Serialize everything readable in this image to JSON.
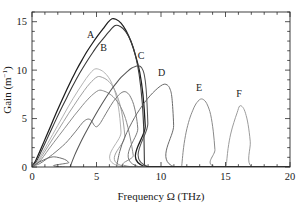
{
  "figure": {
    "top_caption_sliver": "",
    "background": "#ffffff",
    "frame_color": "#2b2b2b"
  },
  "chart_data": {
    "type": "line",
    "title": "",
    "subtitle": "",
    "xlabel": "Frequency Ω (THz)",
    "ylabel": "Gain (m⁻¹)",
    "ylabel_base": "Gain (m",
    "ylabel_exponent": "−1",
    "ylabel_close": ")",
    "xlim": [
      0,
      20
    ],
    "ylim": [
      0,
      16
    ],
    "xticks": [
      0,
      5,
      10,
      15,
      20
    ],
    "xtick_labels": [
      "0",
      "5",
      "10",
      "15",
      "20"
    ],
    "yticks": [
      0,
      5,
      10,
      15
    ],
    "ytick_labels": [
      "0",
      "5",
      "10",
      "15"
    ],
    "xminor_step": 1,
    "yminor_step": 1,
    "grid": false,
    "legend": "inline-curve-labels",
    "annotations": [
      {
        "text": "A",
        "x": 4.55,
        "y": 13.35
      },
      {
        "text": "B",
        "x": 5.55,
        "y": 11.95
      },
      {
        "text": "C",
        "x": 8.45,
        "y": 11.15
      },
      {
        "text": "D",
        "x": 10.05,
        "y": 9.35
      },
      {
        "text": "E",
        "x": 12.95,
        "y": 7.85
      },
      {
        "text": "F",
        "x": 16.05,
        "y": 7.25
      }
    ],
    "series": [
      {
        "name": "A",
        "label": "A",
        "color": "#1c1c1c",
        "width": 1.25,
        "peak_x": 6.2,
        "peak_y": 15.3,
        "onset_x": 0.0,
        "cutoff_x": 8.85,
        "points": [
          [
            0.0,
            0.05
          ],
          [
            0.3,
            0.7
          ],
          [
            0.7,
            1.9
          ],
          [
            1.1,
            3.15
          ],
          [
            1.5,
            4.4
          ],
          [
            1.9,
            5.65
          ],
          [
            2.3,
            6.85
          ],
          [
            2.7,
            8.0
          ],
          [
            3.1,
            9.1
          ],
          [
            3.5,
            10.15
          ],
          [
            3.9,
            11.1
          ],
          [
            4.3,
            12.0
          ],
          [
            4.7,
            12.8
          ],
          [
            5.1,
            13.55
          ],
          [
            5.5,
            14.25
          ],
          [
            5.9,
            14.95
          ],
          [
            6.2,
            15.3
          ],
          [
            6.5,
            15.25
          ],
          [
            6.9,
            14.85
          ],
          [
            7.3,
            14.05
          ],
          [
            7.7,
            12.85
          ],
          [
            8.05,
            11.4
          ],
          [
            8.35,
            9.8
          ],
          [
            8.6,
            7.5
          ],
          [
            8.78,
            4.2
          ],
          [
            8.85,
            0.0
          ],
          [
            20.0,
            0.0
          ]
        ]
      },
      {
        "name": "B",
        "label": "B",
        "color": "#3a3a3a",
        "width": 1.1,
        "peak_x": 6.45,
        "peak_y": 14.6,
        "onset_x": 0.0,
        "cutoff_x": 8.72,
        "points": [
          [
            0.0,
            0.05
          ],
          [
            0.35,
            0.6
          ],
          [
            0.75,
            1.7
          ],
          [
            1.15,
            2.85
          ],
          [
            1.55,
            4.0
          ],
          [
            1.95,
            5.15
          ],
          [
            2.35,
            6.25
          ],
          [
            2.75,
            7.3
          ],
          [
            3.15,
            8.35
          ],
          [
            3.55,
            9.35
          ],
          [
            3.95,
            10.25
          ],
          [
            4.35,
            11.1
          ],
          [
            4.75,
            11.9
          ],
          [
            5.15,
            12.65
          ],
          [
            5.55,
            13.3
          ],
          [
            5.95,
            13.95
          ],
          [
            6.45,
            14.6
          ],
          [
            6.85,
            14.5
          ],
          [
            7.25,
            14.0
          ],
          [
            7.65,
            13.05
          ],
          [
            8.0,
            11.6
          ],
          [
            8.3,
            9.6
          ],
          [
            8.55,
            6.6
          ],
          [
            8.68,
            3.2
          ],
          [
            8.72,
            0.0
          ],
          [
            20.0,
            0.0
          ]
        ]
      },
      {
        "name": "unlabeled-1",
        "label": "",
        "color": "#b4b4b4",
        "width": 1.0,
        "peak_x": 4.85,
        "peak_y": 10.1,
        "onset_x": 0.0,
        "cutoff_x": 7.0,
        "points": [
          [
            0.0,
            0.05
          ],
          [
            0.4,
            0.55
          ],
          [
            0.8,
            1.45
          ],
          [
            1.2,
            2.4
          ],
          [
            1.6,
            3.35
          ],
          [
            2.0,
            4.3
          ],
          [
            2.4,
            5.25
          ],
          [
            2.8,
            6.2
          ],
          [
            3.2,
            7.1
          ],
          [
            3.6,
            7.95
          ],
          [
            4.0,
            8.75
          ],
          [
            4.4,
            9.5
          ],
          [
            4.85,
            10.1
          ],
          [
            5.25,
            10.05
          ],
          [
            5.65,
            9.7
          ],
          [
            6.05,
            9.0
          ],
          [
            6.4,
            7.9
          ],
          [
            6.7,
            6.2
          ],
          [
            6.9,
            3.6
          ],
          [
            7.0,
            0.0
          ],
          [
            20.0,
            0.0
          ]
        ]
      },
      {
        "name": "unlabeled-2",
        "label": "",
        "color": "#a0a0a0",
        "width": 1.0,
        "peak_x": 5.05,
        "peak_y": 9.3,
        "onset_x": 0.0,
        "cutoff_x": 7.35,
        "points": [
          [
            0.0,
            0.05
          ],
          [
            0.45,
            0.5
          ],
          [
            0.85,
            1.3
          ],
          [
            1.25,
            2.15
          ],
          [
            1.65,
            3.0
          ],
          [
            2.05,
            3.85
          ],
          [
            2.45,
            4.7
          ],
          [
            2.85,
            5.55
          ],
          [
            3.25,
            6.35
          ],
          [
            3.65,
            7.15
          ],
          [
            4.05,
            7.9
          ],
          [
            4.5,
            8.65
          ],
          [
            5.05,
            9.3
          ],
          [
            5.45,
            9.25
          ],
          [
            5.85,
            8.95
          ],
          [
            6.25,
            8.35
          ],
          [
            6.6,
            7.35
          ],
          [
            6.95,
            5.7
          ],
          [
            7.2,
            3.2
          ],
          [
            7.35,
            0.0
          ],
          [
            20.0,
            0.0
          ]
        ]
      },
      {
        "name": "unlabeled-3",
        "label": "",
        "color": "#8c8c8c",
        "width": 1.0,
        "peak_x": 5.15,
        "peak_y": 7.9,
        "onset_x": 0.0,
        "cutoff_x": 7.95,
        "points": [
          [
            0.0,
            0.05
          ],
          [
            0.5,
            0.45
          ],
          [
            0.9,
            1.1
          ],
          [
            1.3,
            1.85
          ],
          [
            1.7,
            2.55
          ],
          [
            2.1,
            3.25
          ],
          [
            2.5,
            3.95
          ],
          [
            2.9,
            4.65
          ],
          [
            3.3,
            5.35
          ],
          [
            3.7,
            6.0
          ],
          [
            4.1,
            6.65
          ],
          [
            4.6,
            7.35
          ],
          [
            5.15,
            7.9
          ],
          [
            5.55,
            7.85
          ],
          [
            5.95,
            7.6
          ],
          [
            6.4,
            7.1
          ],
          [
            6.85,
            6.25
          ],
          [
            7.25,
            5.0
          ],
          [
            7.6,
            3.1
          ],
          [
            7.85,
            1.2
          ],
          [
            7.95,
            0.0
          ],
          [
            20.0,
            0.0
          ]
        ]
      },
      {
        "name": "unlabeled-4-lumpy",
        "label": "",
        "color": "#7a7a7a",
        "width": 1.0,
        "peak_x": 4.35,
        "peak_y": 4.95,
        "onset_x": 0.0,
        "cutoff_x": 8.35,
        "points": [
          [
            0.0,
            0.05
          ],
          [
            0.6,
            0.35
          ],
          [
            1.1,
            0.8
          ],
          [
            1.6,
            1.3
          ],
          [
            2.1,
            1.85
          ],
          [
            2.6,
            2.45
          ],
          [
            3.0,
            3.05
          ],
          [
            3.4,
            3.7
          ],
          [
            3.75,
            4.3
          ],
          [
            4.05,
            4.75
          ],
          [
            4.35,
            4.95
          ],
          [
            4.6,
            4.8
          ],
          [
            4.8,
            4.35
          ],
          [
            5.0,
            4.15
          ],
          [
            5.25,
            4.45
          ],
          [
            5.55,
            5.1
          ],
          [
            5.9,
            5.9
          ],
          [
            6.3,
            6.75
          ],
          [
            6.7,
            7.4
          ],
          [
            7.05,
            7.75
          ],
          [
            7.35,
            7.7
          ],
          [
            7.65,
            7.2
          ],
          [
            7.95,
            6.1
          ],
          [
            8.2,
            4.0
          ],
          [
            8.35,
            0.0
          ],
          [
            20.0,
            0.0
          ]
        ]
      },
      {
        "name": "small-bump",
        "label": "",
        "color": "#6f6f6f",
        "width": 1.0,
        "peak_x": 1.65,
        "peak_y": 1.05,
        "onset_x": 0.0,
        "cutoff_x": 2.95,
        "points": [
          [
            0.0,
            0.05
          ],
          [
            0.25,
            0.25
          ],
          [
            0.55,
            0.5
          ],
          [
            0.85,
            0.7
          ],
          [
            1.15,
            0.88
          ],
          [
            1.45,
            1.0
          ],
          [
            1.65,
            1.05
          ],
          [
            1.9,
            1.02
          ],
          [
            2.15,
            0.95
          ],
          [
            2.4,
            0.85
          ],
          [
            2.65,
            0.7
          ],
          [
            2.85,
            0.45
          ],
          [
            2.95,
            0.0
          ],
          [
            20.0,
            0.0
          ]
        ]
      },
      {
        "name": "C",
        "label": "C",
        "color": "#565656",
        "width": 1.05,
        "peak_x": 8.25,
        "peak_y": 10.45,
        "onset_x": 2.95,
        "cutoff_x": 9.05,
        "points": [
          [
            2.95,
            0.0
          ],
          [
            3.3,
            1.2
          ],
          [
            3.7,
            2.35
          ],
          [
            4.1,
            3.4
          ],
          [
            4.5,
            4.4
          ],
          [
            4.9,
            5.35
          ],
          [
            5.3,
            6.25
          ],
          [
            5.7,
            7.1
          ],
          [
            6.1,
            7.9
          ],
          [
            6.5,
            8.6
          ],
          [
            6.9,
            9.25
          ],
          [
            7.3,
            9.75
          ],
          [
            7.7,
            10.2
          ],
          [
            8.05,
            10.4
          ],
          [
            8.25,
            10.45
          ],
          [
            8.5,
            10.25
          ],
          [
            8.7,
            9.55
          ],
          [
            8.85,
            8.0
          ],
          [
            8.98,
            4.5
          ],
          [
            9.05,
            0.0
          ],
          [
            20.0,
            0.0
          ]
        ]
      },
      {
        "name": "D",
        "label": "D",
        "color": "#6a6a6a",
        "width": 1.0,
        "peak_x": 10.25,
        "peak_y": 8.55,
        "onset_x": 6.55,
        "cutoff_x": 11.05,
        "points": [
          [
            6.55,
            0.0
          ],
          [
            6.8,
            1.6
          ],
          [
            7.15,
            2.95
          ],
          [
            7.55,
            4.1
          ],
          [
            7.95,
            5.1
          ],
          [
            8.35,
            5.95
          ],
          [
            8.75,
            6.7
          ],
          [
            9.15,
            7.35
          ],
          [
            9.55,
            7.9
          ],
          [
            9.95,
            8.35
          ],
          [
            10.25,
            8.55
          ],
          [
            10.5,
            8.45
          ],
          [
            10.7,
            8.05
          ],
          [
            10.85,
            7.1
          ],
          [
            10.98,
            4.3
          ],
          [
            11.05,
            0.0
          ],
          [
            20.0,
            0.0
          ]
        ]
      },
      {
        "name": "E",
        "label": "E",
        "color": "#8a8a8a",
        "width": 1.0,
        "peak_x": 13.05,
        "peak_y": 7.0,
        "onset_x": 11.6,
        "cutoff_x": 14.25,
        "points": [
          [
            11.6,
            0.0
          ],
          [
            11.75,
            2.0
          ],
          [
            11.95,
            3.6
          ],
          [
            12.2,
            4.9
          ],
          [
            12.45,
            5.8
          ],
          [
            12.7,
            6.5
          ],
          [
            13.05,
            7.0
          ],
          [
            13.35,
            6.9
          ],
          [
            13.6,
            6.4
          ],
          [
            13.85,
            5.4
          ],
          [
            14.05,
            3.7
          ],
          [
            14.18,
            1.8
          ],
          [
            14.25,
            0.0
          ],
          [
            20.0,
            0.0
          ]
        ]
      },
      {
        "name": "F",
        "label": "F",
        "color": "#9c9c9c",
        "width": 1.0,
        "peak_x": 16.1,
        "peak_y": 6.3,
        "onset_x": 15.05,
        "cutoff_x": 17.05,
        "points": [
          [
            15.05,
            0.0
          ],
          [
            15.2,
            1.9
          ],
          [
            15.4,
            3.4
          ],
          [
            15.65,
            4.6
          ],
          [
            15.9,
            5.6
          ],
          [
            16.1,
            6.3
          ],
          [
            16.35,
            6.15
          ],
          [
            16.55,
            5.55
          ],
          [
            16.75,
            4.4
          ],
          [
            16.92,
            2.6
          ],
          [
            17.05,
            0.0
          ],
          [
            20.0,
            0.0
          ]
        ]
      },
      {
        "name": "baseline",
        "label": "",
        "color": "#1c1c1c",
        "width": 1.3,
        "peak_x": 0,
        "peak_y": 0,
        "onset_x": 8.85,
        "cutoff_x": 20,
        "points": [
          [
            8.85,
            0.0
          ],
          [
            20.0,
            0.0
          ]
        ]
      }
    ]
  }
}
